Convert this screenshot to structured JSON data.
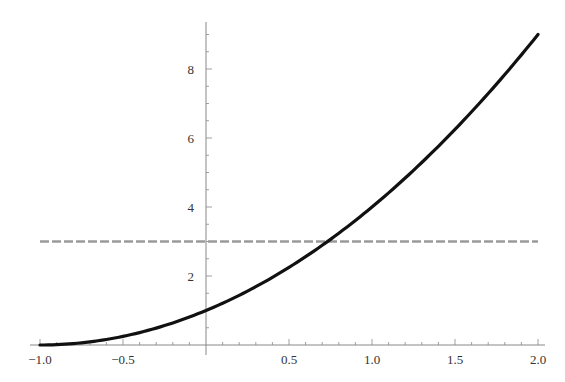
{
  "chart_data": {
    "type": "line",
    "title": "",
    "xlabel": "",
    "ylabel": "",
    "xlim": [
      -1.0,
      2.0
    ],
    "ylim": [
      0,
      9
    ],
    "grid": false,
    "legend": null,
    "x_ticks": [
      -1.0,
      -0.5,
      0.5,
      1.0,
      1.5,
      2.0
    ],
    "x_tick_labels": [
      "−1.0",
      "−0.5",
      "0.5",
      "1.0",
      "1.5",
      "2.0"
    ],
    "y_ticks": [
      2,
      4,
      6,
      8
    ],
    "y_tick_labels": [
      "2",
      "4",
      "6",
      "8"
    ],
    "series": [
      {
        "name": "curve",
        "style": "solid",
        "color": "#111111",
        "formula": "(x+1)^2",
        "formula_note": "assumed fit, not confirmed: inferred from approximate readings f(-1)~0, f(0)~1, f(2)~9; sample values below are computed from this assumed form",
        "x": [
          -1.0,
          -0.75,
          -0.5,
          -0.25,
          0.0,
          0.25,
          0.5,
          0.75,
          1.0,
          1.25,
          1.5,
          1.75,
          2.0
        ],
        "y": [
          0.0,
          0.0625,
          0.25,
          0.5625,
          1.0,
          1.5625,
          2.25,
          3.0625,
          4.0,
          5.0625,
          6.25,
          7.5625,
          9.0
        ]
      },
      {
        "name": "horizontal-reference",
        "style": "dashed",
        "color": "#999999",
        "x": [
          -1.0,
          2.0
        ],
        "y": [
          3,
          3
        ]
      }
    ],
    "annotations": []
  },
  "axes": {
    "x_tick_labels": [
      "−1.0",
      "−0.5",
      "0.5",
      "1.0",
      "1.5",
      "2.0"
    ],
    "y_tick_labels": [
      "2",
      "4",
      "6",
      "8"
    ]
  }
}
